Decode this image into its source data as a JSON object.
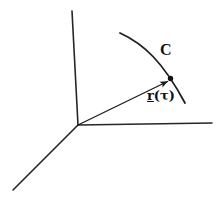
{
  "figure": {
    "background_color": "#ffffff",
    "stroke_color": "#262626",
    "text_color": "#111111",
    "width": 220,
    "height": 198
  },
  "labels": {
    "curve_label": "C",
    "vector_symbol": "r",
    "vector_argument": "(τ)"
  },
  "geometry": {
    "origin": {
      "x": 78,
      "y": 125
    },
    "axes": [
      {
        "name": "vertical-axis",
        "x1": 72,
        "y1": 11,
        "x2": 78,
        "y2": 125
      },
      {
        "name": "horizontal-axis",
        "x1": 78,
        "y1": 125,
        "x2": 212,
        "y2": 123
      },
      {
        "name": "depth-axis",
        "x1": 78,
        "y1": 125,
        "x2": 13,
        "y2": 190
      }
    ],
    "vector": {
      "x1": 78,
      "y1": 125,
      "x2": 170,
      "y2": 80
    },
    "curve": {
      "start": {
        "x": 120,
        "y": 33
      },
      "control1": {
        "x": 144,
        "y": 44
      },
      "control2": {
        "x": 163,
        "y": 62
      },
      "end": {
        "x": 185,
        "y": 103
      }
    },
    "point_on_curve": {
      "x": 170,
      "y": 79,
      "r": 2.6
    }
  }
}
